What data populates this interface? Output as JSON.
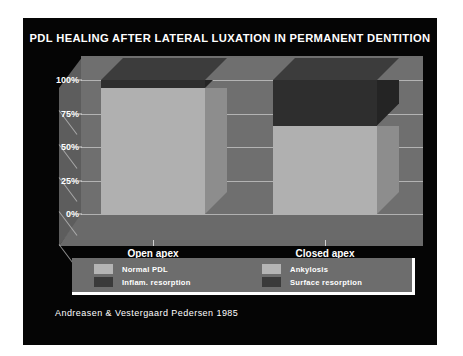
{
  "slide": {
    "background_color": "#050505",
    "title": "PDL HEALING AFTER LATERAL LUXATION IN PERMANENT DENTITION",
    "attribution": "Andreasen & Vestergaard Pedersen 1985"
  },
  "legend": {
    "entries": [
      {
        "label": "Normal PDL",
        "color": "#b4b4b4"
      },
      {
        "label": "Ankylosis",
        "color": "#b4b4b4"
      },
      {
        "label": "Inflam. resorption",
        "color": "#3a3a3a"
      },
      {
        "label": "Surface resorption",
        "color": "#3a3a3a"
      }
    ]
  },
  "axis": {
    "yticks": [
      "100%",
      "75%",
      "50%",
      "25%",
      "0%"
    ],
    "ytick_values": [
      100,
      75,
      50,
      25,
      0
    ]
  },
  "chart_data": {
    "type": "bar",
    "subtype": "stacked-3d-column",
    "title": "PDL HEALING AFTER LATERAL LUXATION IN PERMANENT DENTITION",
    "xlabel": "",
    "ylabel": "",
    "ylim": [
      0,
      100
    ],
    "yticks": [
      0,
      25,
      50,
      75,
      100
    ],
    "ytick_labels": [
      "0%",
      "25%",
      "50%",
      "75%",
      "100%"
    ],
    "grid": true,
    "legend_position": "bottom",
    "units": "percent",
    "categories": [
      "Open apex",
      "Closed apex"
    ],
    "series": [
      {
        "name": "Normal PDL",
        "color": "#b4b4b4",
        "values": [
          94,
          66
        ]
      },
      {
        "name": "Ankylosis",
        "color": "#b4b4b4",
        "values": [
          0,
          0
        ]
      },
      {
        "name": "Inflam. resorption",
        "color": "#3a3a3a",
        "values": [
          0,
          0
        ]
      },
      {
        "name": "Surface resorption",
        "color": "#3a3a3a",
        "values": [
          6,
          34
        ]
      }
    ],
    "annotations": [
      "Andreasen & Vestergaard Pedersen 1985"
    ]
  },
  "bars": [
    {
      "category": "Open apex",
      "segments": [
        {
          "name": "Normal PDL",
          "value": 94,
          "front": "#b0b0b0",
          "side": "#8d8d8d",
          "top": "#c6c6c6"
        },
        {
          "name": "Surface resorption",
          "value": 6,
          "front": "#2e2e2e",
          "side": "#242424",
          "top": "#3c3c3c"
        }
      ]
    },
    {
      "category": "Closed apex",
      "segments": [
        {
          "name": "Normal PDL",
          "value": 66,
          "front": "#b0b0b0",
          "side": "#8d8d8d",
          "top": "#c6c6c6"
        },
        {
          "name": "Surface resorption",
          "value": 34,
          "front": "#2e2e2e",
          "side": "#242424",
          "top": "#3c3c3c"
        }
      ]
    }
  ]
}
